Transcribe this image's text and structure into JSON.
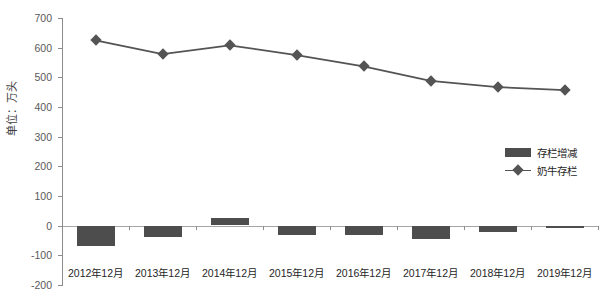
{
  "chart_data": {
    "type": "bar",
    "title": "",
    "xlabel": "",
    "ylabel": "单位：万头",
    "categories": [
      "2012年12月",
      "2013年12月",
      "2014年12月",
      "2015年12月",
      "2016年12月",
      "2017年12月",
      "2018年12月",
      "2019年12月"
    ],
    "series": [
      {
        "name": "存栏增减",
        "type": "bar",
        "values": [
          -68,
          -38,
          25,
          -30,
          -32,
          -45,
          -20,
          -8
        ]
      },
      {
        "name": "奶牛存栏",
        "type": "line",
        "values": [
          625,
          578,
          608,
          575,
          537,
          488,
          467,
          457
        ]
      }
    ],
    "ylim": [
      -200,
      700
    ],
    "yticks": [
      700,
      600,
      500,
      400,
      300,
      200,
      100,
      0,
      -100,
      -200
    ],
    "ytick_labels": [
      "700",
      "600",
      "500",
      "400",
      "300",
      "200",
      "100",
      "0",
      "-100",
      "-200"
    ],
    "grid": false,
    "legend_position": "center-right",
    "colors": {
      "bar": "#4d4d4d",
      "line": "#545454",
      "axis": "#8c8c8c",
      "text": "#262626"
    }
  },
  "legend": {
    "items": [
      {
        "label": "存栏增减",
        "marker": "bar-swatch-icon"
      },
      {
        "label": "奶牛存栏",
        "marker": "diamond-line-icon"
      }
    ]
  },
  "axis": {
    "y_title": "单位：万头"
  }
}
